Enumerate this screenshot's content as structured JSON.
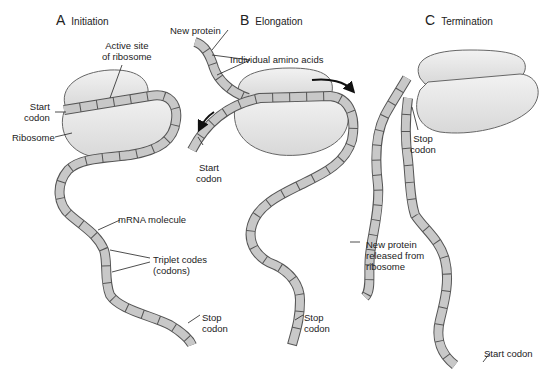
{
  "panels": [
    {
      "letter": "A",
      "title": "Initiation",
      "labels": {
        "active_site": "Active site\nof ribosome",
        "start_codon": "Start\ncodon",
        "ribosome": "Ribosome",
        "mrna": "mRNA molecule",
        "triplet": "Triplet codes\n(codons)",
        "stop_codon": "Stop\ncodon"
      }
    },
    {
      "letter": "B",
      "title": "Elongation",
      "labels": {
        "new_protein": "New protein",
        "amino_acids": "Individual amino acids",
        "start_codon": "Start\ncodon",
        "stop_codon": "Stop\ncodon"
      }
    },
    {
      "letter": "C",
      "title": "Termination",
      "labels": {
        "stop_codon": "Stop\ncodon",
        "released": "New protein\nreleased from\nribosome",
        "start_codon": "Start codon"
      }
    }
  ],
  "colors": {
    "strand_fill": "#c8c8c8",
    "strand_stroke": "#555555",
    "ribosome_fill": "#e6e6e6",
    "ribosome_stroke": "#666666",
    "text": "#222222"
  }
}
